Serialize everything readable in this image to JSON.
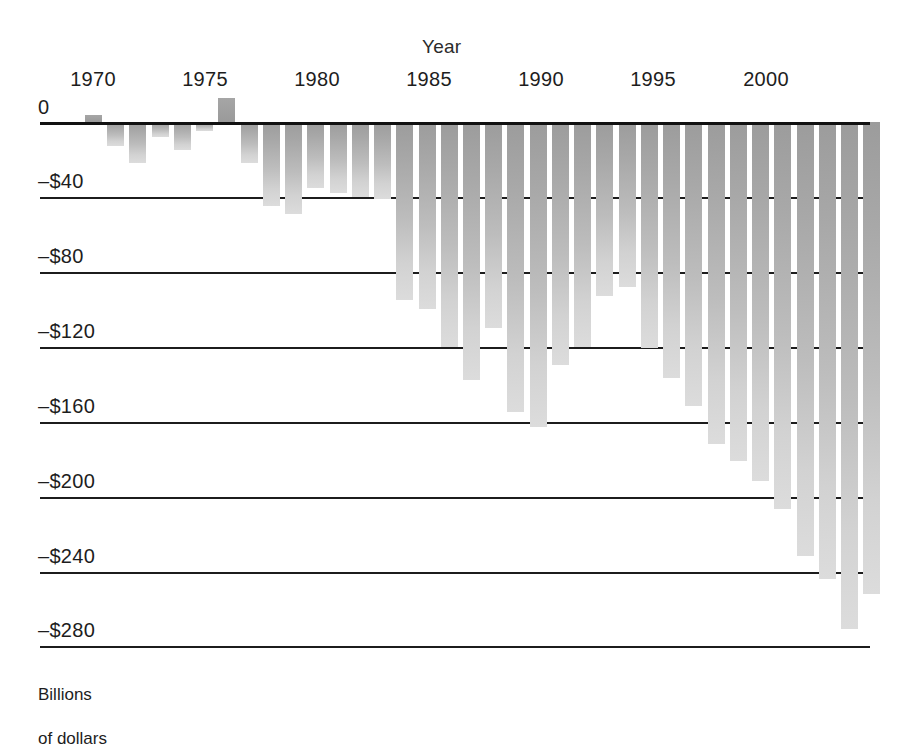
{
  "chart_data": {
    "type": "bar",
    "title": "",
    "xlabel": "Year",
    "ylabel": "Billions\nof dollars",
    "ylim": [
      -300,
      20
    ],
    "yticks": [
      0,
      -40,
      -80,
      -120,
      -160,
      -200,
      -240,
      -280
    ],
    "ytick_labels": [
      "0",
      "–$40",
      "–$80",
      "–$120",
      "–$160",
      "–$200",
      "–$240",
      "–$280"
    ],
    "xticks": [
      1970,
      1975,
      1980,
      1985,
      1990,
      1995,
      2000
    ],
    "xtick_labels": [
      "1970",
      "1975",
      "1980",
      "1985",
      "1990",
      "1995",
      "2000"
    ],
    "grid": true,
    "legend": "none",
    "bar_color": "#b4b4b4",
    "axis_color": "#1c1c1c",
    "categories": [
      1969,
      1970,
      1971,
      1972,
      1973,
      1974,
      1975,
      1976,
      1977,
      1978,
      1979,
      1980,
      1981,
      1982,
      1983,
      1984,
      1985,
      1986,
      1987,
      1988,
      1989,
      1990,
      1991,
      1992,
      1993,
      1994,
      1995,
      1996,
      1997,
      1998,
      1999,
      2000,
      2001,
      2002
    ],
    "values": [
      3,
      -3,
      -23,
      -23,
      -15,
      -6,
      8,
      -74,
      -54,
      -59,
      -41,
      -74,
      -79,
      -128,
      -208,
      -185,
      -212,
      -221,
      -150,
      -155,
      -153,
      -221,
      -269,
      -290,
      -255,
      -203,
      -164,
      -107,
      -22,
      69,
      126,
      236,
      127,
      -158
    ],
    "values_note": "Bar heights read from the plot, in billions of dollars",
    "bars_px": [
      {
        "year": 1969,
        "x": 45,
        "w": 17,
        "value": 4
      },
      {
        "year": 1970,
        "x": 67,
        "w": 17,
        "value": -13
      },
      {
        "year": 1971,
        "x": 89,
        "w": 17,
        "value": -22
      },
      {
        "year": 1972,
        "x": 112,
        "w": 17,
        "value": -8
      },
      {
        "year": 1973,
        "x": 134,
        "w": 17,
        "value": -15
      },
      {
        "year": 1974,
        "x": 156,
        "w": 17,
        "value": -5
      },
      {
        "year": 1975,
        "x": 178,
        "w": 17,
        "value": 13
      },
      {
        "year": 1976,
        "x": 201,
        "w": 17,
        "value": -22
      },
      {
        "year": 1977,
        "x": 223,
        "w": 17,
        "value": -45
      },
      {
        "year": 1978,
        "x": 245,
        "w": 17,
        "value": -49
      },
      {
        "year": 1979,
        "x": 267,
        "w": 17,
        "value": -35
      },
      {
        "year": 1980,
        "x": 290,
        "w": 17,
        "value": -38
      },
      {
        "year": 1981,
        "x": 312,
        "w": 17,
        "value": -40
      },
      {
        "year": 1982,
        "x": 334,
        "w": 17,
        "value": -41
      },
      {
        "year": 1983,
        "x": 356,
        "w": 17,
        "value": -95
      },
      {
        "year": 1984,
        "x": 379,
        "w": 17,
        "value": -100
      },
      {
        "year": 1985,
        "x": 401,
        "w": 17,
        "value": -120
      },
      {
        "year": 1986,
        "x": 423,
        "w": 17,
        "value": -138
      },
      {
        "year": 1987,
        "x": 445,
        "w": 17,
        "value": -110
      },
      {
        "year": 1988,
        "x": 467,
        "w": 17,
        "value": -155
      },
      {
        "year": 1989,
        "x": 490,
        "w": 17,
        "value": -163
      },
      {
        "year": 1990,
        "x": 512,
        "w": 17,
        "value": -130
      },
      {
        "year": 1991,
        "x": 534,
        "w": 17,
        "value": -120
      },
      {
        "year": 1992,
        "x": 556,
        "w": 17,
        "value": -93
      },
      {
        "year": 1993,
        "x": 579,
        "w": 17,
        "value": -88
      },
      {
        "year": 1994,
        "x": 601,
        "w": 17,
        "value": -121
      },
      {
        "year": 1995,
        "x": 623,
        "w": 17,
        "value": -137
      },
      {
        "year": 1996,
        "x": 645,
        "w": 17,
        "value": -152
      },
      {
        "year": 1997,
        "x": 668,
        "w": 17,
        "value": -172
      },
      {
        "year": 1998,
        "x": 690,
        "w": 17,
        "value": -181
      },
      {
        "year": 1999,
        "x": 712,
        "w": 17,
        "value": -192
      },
      {
        "year": 2000,
        "x": 734,
        "w": 17,
        "value": -207
      },
      {
        "year": 2001,
        "x": 757,
        "w": 17,
        "value": -232
      },
      {
        "year": 2002,
        "x": 779,
        "w": 17,
        "value": -244
      },
      {
        "year": 2003,
        "x": 801,
        "w": 17,
        "value": -271
      },
      {
        "year": 2004,
        "x": 823,
        "w": 17,
        "value": -252
      }
    ]
  },
  "axes": {
    "year_title": "Year",
    "y_caption_line1": "Billions",
    "y_caption_line2": "of dollars",
    "y_ticks": [
      {
        "label": "0",
        "y": 122
      },
      {
        "label": "–$40",
        "y": 197
      },
      {
        "label": "–$80",
        "y": 272
      },
      {
        "label": "–$120",
        "y": 347
      },
      {
        "label": "–$160",
        "y": 422
      },
      {
        "label": "–$200",
        "y": 497
      },
      {
        "label": "–$240",
        "y": 572
      },
      {
        "label": "–$280",
        "y": 646
      }
    ],
    "x_ticks": [
      {
        "label": "1970",
        "x": 93
      },
      {
        "label": "1975",
        "x": 205
      },
      {
        "label": "1980",
        "x": 317
      },
      {
        "label": "1985",
        "x": 429
      },
      {
        "label": "1990",
        "x": 541
      },
      {
        "label": "1995",
        "x": 653
      },
      {
        "label": "2000",
        "x": 766
      }
    ]
  }
}
